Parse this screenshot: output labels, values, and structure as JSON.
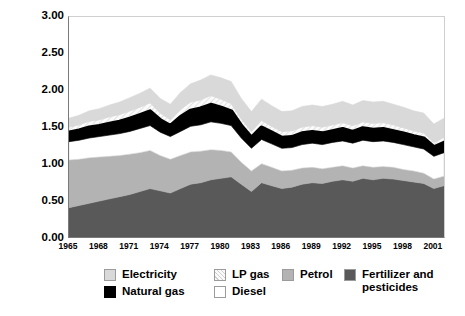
{
  "chart_data": {
    "type": "area",
    "title": "",
    "xlabel": "",
    "ylabel": "Quadrillion Btu",
    "ylim": [
      0.0,
      3.0
    ],
    "ytick_labels": [
      "3.00",
      "2.50",
      "2.00",
      "1.50",
      "1.00",
      "0.50",
      "0.00"
    ],
    "ytick_values": [
      3.0,
      2.5,
      2.0,
      1.5,
      1.0,
      0.5,
      0.0
    ],
    "xlim": [
      1965,
      2002
    ],
    "xtick_labels": [
      "1965",
      "1968",
      "1971",
      "1974",
      "1977",
      "1980",
      "1983",
      "1986",
      "1989",
      "1992",
      "1995",
      "1998",
      "2001"
    ],
    "xtick_values": [
      1965,
      1968,
      1971,
      1974,
      1977,
      1980,
      1983,
      1986,
      1989,
      1992,
      1995,
      1998,
      2001
    ],
    "grid": false,
    "legend_position": "bottom",
    "stacked": true,
    "x": [
      1965,
      1966,
      1967,
      1968,
      1969,
      1970,
      1971,
      1972,
      1973,
      1974,
      1975,
      1976,
      1977,
      1978,
      1979,
      1980,
      1981,
      1982,
      1983,
      1984,
      1985,
      1986,
      1987,
      1988,
      1989,
      1990,
      1991,
      1992,
      1993,
      1994,
      1995,
      1996,
      1997,
      1998,
      1999,
      2000,
      2001,
      2002
    ],
    "series": [
      {
        "name": "Fertilizer and pesticides",
        "color": "#595959",
        "values": [
          0.4,
          0.43,
          0.46,
          0.49,
          0.52,
          0.55,
          0.58,
          0.62,
          0.66,
          0.63,
          0.6,
          0.66,
          0.72,
          0.74,
          0.78,
          0.8,
          0.82,
          0.72,
          0.62,
          0.74,
          0.7,
          0.66,
          0.68,
          0.72,
          0.74,
          0.73,
          0.76,
          0.78,
          0.76,
          0.8,
          0.78,
          0.8,
          0.79,
          0.77,
          0.75,
          0.73,
          0.66,
          0.7
        ]
      },
      {
        "name": "Petrol",
        "color": "#b3b3b3",
        "values": [
          0.65,
          0.63,
          0.62,
          0.6,
          0.58,
          0.56,
          0.55,
          0.53,
          0.52,
          0.48,
          0.46,
          0.45,
          0.44,
          0.43,
          0.41,
          0.38,
          0.34,
          0.3,
          0.28,
          0.26,
          0.25,
          0.24,
          0.23,
          0.22,
          0.21,
          0.2,
          0.19,
          0.19,
          0.18,
          0.17,
          0.17,
          0.16,
          0.16,
          0.15,
          0.15,
          0.14,
          0.13,
          0.13
        ]
      },
      {
        "name": "Diesel",
        "color": "#ffffff",
        "values": [
          0.25,
          0.26,
          0.27,
          0.28,
          0.29,
          0.3,
          0.31,
          0.33,
          0.34,
          0.32,
          0.31,
          0.33,
          0.35,
          0.36,
          0.38,
          0.37,
          0.36,
          0.33,
          0.31,
          0.33,
          0.32,
          0.31,
          0.31,
          0.32,
          0.33,
          0.33,
          0.34,
          0.34,
          0.34,
          0.35,
          0.35,
          0.35,
          0.34,
          0.34,
          0.33,
          0.33,
          0.31,
          0.32
        ]
      },
      {
        "name": "Natural gas",
        "color": "#000000",
        "values": [
          0.12,
          0.13,
          0.14,
          0.14,
          0.15,
          0.16,
          0.17,
          0.18,
          0.19,
          0.16,
          0.14,
          0.19,
          0.21,
          0.22,
          0.23,
          0.21,
          0.19,
          0.16,
          0.14,
          0.16,
          0.15,
          0.14,
          0.14,
          0.15,
          0.15,
          0.15,
          0.15,
          0.16,
          0.15,
          0.16,
          0.16,
          0.16,
          0.15,
          0.15,
          0.14,
          0.14,
          0.12,
          0.13
        ]
      },
      {
        "name": "LP gas",
        "color": "#f2f2f2",
        "values": [
          0.08,
          0.08,
          0.09,
          0.09,
          0.1,
          0.1,
          0.11,
          0.11,
          0.12,
          0.1,
          0.09,
          0.11,
          0.12,
          0.12,
          0.13,
          0.12,
          0.11,
          0.1,
          0.09,
          0.1,
          0.09,
          0.09,
          0.09,
          0.09,
          0.09,
          0.09,
          0.09,
          0.09,
          0.09,
          0.09,
          0.09,
          0.09,
          0.09,
          0.08,
          0.08,
          0.08,
          0.07,
          0.08
        ]
      },
      {
        "name": "Electricity",
        "color": "#d9d9d9",
        "values": [
          0.12,
          0.13,
          0.14,
          0.15,
          0.16,
          0.17,
          0.18,
          0.19,
          0.2,
          0.2,
          0.21,
          0.23,
          0.25,
          0.27,
          0.28,
          0.29,
          0.3,
          0.28,
          0.27,
          0.29,
          0.28,
          0.27,
          0.27,
          0.28,
          0.28,
          0.28,
          0.28,
          0.29,
          0.28,
          0.29,
          0.29,
          0.29,
          0.28,
          0.28,
          0.27,
          0.27,
          0.25,
          0.26
        ]
      }
    ],
    "highlight_line": {
      "name": "Natural gas top boundary",
      "color": "#000000",
      "values": [
        1.42,
        1.45,
        1.49,
        1.51,
        1.54,
        1.57,
        1.61,
        1.66,
        1.71,
        1.59,
        1.51,
        1.63,
        1.72,
        1.75,
        1.8,
        1.76,
        1.71,
        1.51,
        1.35,
        1.49,
        1.42,
        1.35,
        1.36,
        1.41,
        1.43,
        1.41,
        1.44,
        1.47,
        1.43,
        1.48,
        1.46,
        1.47,
        1.44,
        1.41,
        1.37,
        1.34,
        1.22,
        1.28
      ]
    },
    "totals": [
      1.62,
      1.66,
      1.72,
      1.75,
      1.8,
      1.84,
      1.9,
      1.96,
      2.03,
      1.89,
      1.81,
      1.97,
      2.09,
      2.14,
      2.21,
      2.17,
      2.12,
      1.89,
      1.71,
      1.88,
      1.79,
      1.71,
      1.72,
      1.78,
      1.8,
      1.78,
      1.81,
      1.85,
      1.8,
      1.86,
      1.84,
      1.85,
      1.81,
      1.77,
      1.72,
      1.69,
      1.54,
      1.62
    ]
  },
  "legend": {
    "items": [
      {
        "label": "Electricity",
        "swatch": "#d9d9d9",
        "pattern": "solid"
      },
      {
        "label": "LP gas",
        "swatch": "#f2f2f2",
        "pattern": "hatch"
      },
      {
        "label": "Petrol",
        "swatch": "#b3b3b3",
        "pattern": "solid"
      },
      {
        "label": "Fertilizer and\npesticides",
        "swatch": "#595959",
        "pattern": "solid"
      },
      {
        "label": "Natural gas",
        "swatch": "#000000",
        "pattern": "solid"
      },
      {
        "label": "Diesel",
        "swatch": "#ffffff",
        "pattern": "solid"
      }
    ]
  },
  "axes": {
    "y_title": "Quadrillion Btu"
  }
}
